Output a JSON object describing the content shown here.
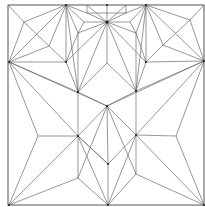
{
  "diagram": {
    "type": "origami-crease-pattern",
    "colors": {
      "line": "#6a6a6a",
      "border": "#555555",
      "vertex": "#222222",
      "background": "#ffffff"
    },
    "border": {
      "x1": 8,
      "y1": 5,
      "x2": 204,
      "y2": 205
    },
    "vertices": {
      "TL": [
        8,
        5
      ],
      "TR": [
        204,
        5
      ],
      "BL": [
        9,
        205
      ],
      "BR": [
        204,
        205
      ],
      "T1": [
        66,
        5
      ],
      "T2": [
        107,
        5
      ],
      "T3": [
        146,
        5
      ],
      "TB1": [
        87,
        5
      ],
      "TB2": [
        126,
        5
      ],
      "TB3": [
        87,
        13
      ],
      "TB4": [
        126,
        13
      ],
      "TS": [
        107,
        22
      ],
      "TSL": [
        84,
        22
      ],
      "TSR": [
        130,
        22
      ],
      "L": [
        9,
        62
      ],
      "R": [
        204,
        61
      ],
      "UL": [
        66,
        62
      ],
      "UR": [
        146,
        62
      ],
      "WL1": [
        24,
        22
      ],
      "WL2": [
        49,
        46
      ],
      "WR1": [
        190,
        20
      ],
      "WR2": [
        163,
        45
      ],
      "ML": [
        78,
        92
      ],
      "MR": [
        136,
        91
      ],
      "C": [
        107,
        106
      ],
      "DL": [
        78,
        136
      ],
      "DR": [
        136,
        135
      ],
      "DB": [
        108,
        164
      ],
      "LM": [
        38,
        136
      ],
      "RM": [
        176,
        136
      ],
      "LL": [
        78,
        178
      ],
      "LR": [
        136,
        174
      ],
      "B": [
        108,
        205
      ],
      "CT": [
        107,
        63
      ],
      "SL": [
        78,
        33
      ],
      "SR": [
        136,
        33
      ]
    },
    "edges": [
      [
        "TL",
        "WL1"
      ],
      [
        "WL1",
        "T1"
      ],
      [
        "WL1",
        "WL2"
      ],
      [
        "WL1",
        "L"
      ],
      [
        "T1",
        "L"
      ],
      [
        "T1",
        "WL2"
      ],
      [
        "T1",
        "UL"
      ],
      [
        "T1",
        "SL"
      ],
      [
        "T1",
        "ML"
      ],
      [
        "WL2",
        "L"
      ],
      [
        "WL2",
        "UL"
      ],
      [
        "L",
        "UL"
      ],
      [
        "L",
        "C"
      ],
      [
        "L",
        "LM"
      ],
      [
        "L",
        "DL"
      ],
      [
        "L",
        "ML"
      ],
      [
        "UL",
        "ML"
      ],
      [
        "UL",
        "TS"
      ],
      [
        "UL",
        "SL"
      ],
      [
        "TR",
        "WR1"
      ],
      [
        "WR1",
        "T3"
      ],
      [
        "WR1",
        "WR2"
      ],
      [
        "WR1",
        "R"
      ],
      [
        "T3",
        "R"
      ],
      [
        "T3",
        "WR2"
      ],
      [
        "T3",
        "UR"
      ],
      [
        "T3",
        "SR"
      ],
      [
        "T3",
        "MR"
      ],
      [
        "WR2",
        "R"
      ],
      [
        "WR2",
        "UR"
      ],
      [
        "R",
        "UR"
      ],
      [
        "R",
        "C"
      ],
      [
        "R",
        "RM"
      ],
      [
        "R",
        "DR"
      ],
      [
        "R",
        "MR"
      ],
      [
        "UR",
        "MR"
      ],
      [
        "UR",
        "TS"
      ],
      [
        "UR",
        "SR"
      ],
      [
        "T2",
        "TS"
      ],
      [
        "TB1",
        "TS"
      ],
      [
        "TB2",
        "TS"
      ],
      [
        "TB3",
        "TS"
      ],
      [
        "TB4",
        "TS"
      ],
      [
        "TB1",
        "TB3"
      ],
      [
        "TB2",
        "TB4"
      ],
      [
        "TB3",
        "TB4"
      ],
      [
        "T1",
        "TSL"
      ],
      [
        "TSL",
        "TS"
      ],
      [
        "T3",
        "TSR"
      ],
      [
        "TSR",
        "TS"
      ],
      [
        "TB3",
        "T1"
      ],
      [
        "TB4",
        "T3"
      ],
      [
        "TSL",
        "SL"
      ],
      [
        "TSR",
        "SR"
      ],
      [
        "TS",
        "SL"
      ],
      [
        "TS",
        "SR"
      ],
      [
        "TS",
        "ML"
      ],
      [
        "TS",
        "MR"
      ],
      [
        "TS",
        "CT"
      ],
      [
        "SL",
        "ML"
      ],
      [
        "SR",
        "MR"
      ],
      [
        "CT",
        "ML"
      ],
      [
        "CT",
        "MR"
      ],
      [
        "ML",
        "C"
      ],
      [
        "MR",
        "C"
      ],
      [
        "ML",
        "DL"
      ],
      [
        "MR",
        "DR"
      ],
      [
        "C",
        "DL"
      ],
      [
        "C",
        "DR"
      ],
      [
        "C",
        "DB"
      ],
      [
        "C",
        "LL"
      ],
      [
        "C",
        "LR"
      ],
      [
        "DL",
        "DB"
      ],
      [
        "DR",
        "DB"
      ],
      [
        "DL",
        "LM"
      ],
      [
        "DR",
        "RM"
      ],
      [
        "DL",
        "BL"
      ],
      [
        "DL",
        "B"
      ],
      [
        "DL",
        "LL"
      ],
      [
        "DL",
        "DB"
      ],
      [
        "DR",
        "BR"
      ],
      [
        "DR",
        "B"
      ],
      [
        "DR",
        "LR"
      ],
      [
        "LM",
        "BL"
      ],
      [
        "RM",
        "BR"
      ],
      [
        "LL",
        "BL"
      ],
      [
        "LL",
        "B"
      ],
      [
        "LR",
        "BR"
      ],
      [
        "LR",
        "B"
      ],
      [
        "DB",
        "B"
      ]
    ],
    "dots": [
      "T1",
      "T2",
      "T3",
      "TS",
      "L",
      "R",
      "UL",
      "UR",
      "ML",
      "MR",
      "C",
      "DL",
      "DR",
      "DB",
      "BL",
      "B",
      "BR"
    ]
  }
}
